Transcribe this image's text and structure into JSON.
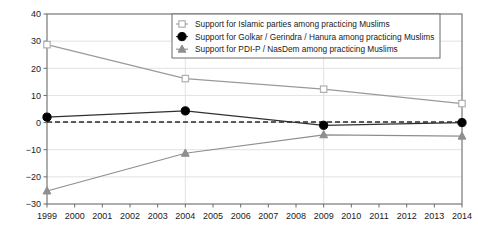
{
  "chart_data": {
    "type": "line",
    "title": "",
    "subtitle": "",
    "xlabel": "",
    "ylabel": "",
    "xlim": [
      1999,
      2014
    ],
    "ylim": [
      -30,
      40
    ],
    "grid": true,
    "legend_position": "top-right",
    "x": [
      1999,
      2004,
      2009,
      2014
    ],
    "xtick_labels": [
      "1999",
      "2000",
      "2001",
      "2002",
      "2003",
      "2004",
      "2005",
      "2006",
      "2007",
      "2008",
      "2009",
      "2010",
      "2011",
      "2012",
      "2013",
      "2014"
    ],
    "ytick_labels": [
      "40",
      "30",
      "20",
      "10",
      "0",
      "−10",
      "−20",
      "−30"
    ],
    "ytick_values": [
      40,
      30,
      20,
      10,
      0,
      -10,
      -20,
      -30
    ],
    "zero_reference_line": 0,
    "series": [
      {
        "name": "Support for Islamic parties among practicing Muslims",
        "marker": "open-square",
        "color": "#b0b0b0",
        "line_color": "#9a9a9a",
        "values": [
          28.7,
          16.2,
          12.3,
          7.0
        ]
      },
      {
        "name": "Support for Golkar / Gerindra / Hanura among practicing Muslims",
        "marker": "filled-circle",
        "color": "#000000",
        "line_color": "#303030",
        "values": [
          2.0,
          4.3,
          -1.0,
          0.0
        ]
      },
      {
        "name": "Support for PDI-P / NasDem among practicing Muslims",
        "marker": "filled-triangle",
        "color": "#8e8e8e",
        "line_color": "#8e8e8e",
        "values": [
          -25.2,
          -11.3,
          -4.5,
          -5.0
        ]
      }
    ]
  },
  "axes": {
    "y_ticks": [
      "40",
      "30",
      "20",
      "10",
      "0",
      "−10",
      "−20",
      "−30"
    ],
    "x_ticks": [
      "1999",
      "2000",
      "2001",
      "2002",
      "2003",
      "2004",
      "2005",
      "2006",
      "2007",
      "2008",
      "2009",
      "2010",
      "2011",
      "2012",
      "2013",
      "2014"
    ]
  },
  "legend": {
    "entries": [
      {
        "label": "Support for Islamic parties among practicing Muslims",
        "marker": "open-square"
      },
      {
        "label": "Support for Golkar / Gerindra / Hanura among practicing Muslims",
        "marker": "filled-circle"
      },
      {
        "label": "Support for PDI-P / NasDem among practicing Muslims",
        "marker": "filled-triangle"
      }
    ]
  },
  "colors": {
    "frame": "#6b6b6b",
    "grid": "#e2e2e2",
    "zero_line": "#2a2a2a",
    "series_islamic": "#9a9a9a",
    "series_golkar": "#000000",
    "series_pdip": "#8e8e8e",
    "text": "#1a1a1a"
  }
}
